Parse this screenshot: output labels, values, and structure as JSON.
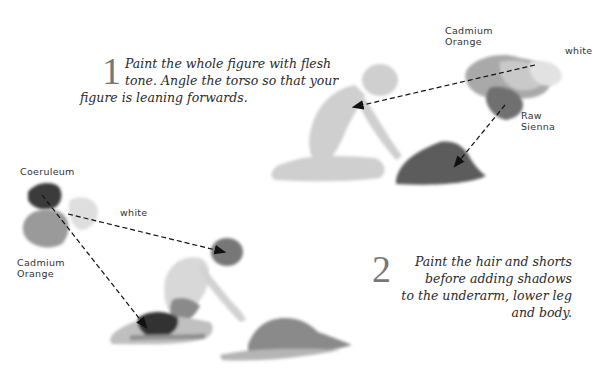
{
  "steps": [
    {
      "number": "1",
      "lines": [
        "Paint the whole figure with flesh",
        "tone. Angle the torso so that your",
        "figure is leaning forwards."
      ]
    },
    {
      "number": "2",
      "lines": [
        "Paint the hair and shorts",
        "before adding shadows",
        "to the underarm, lower leg",
        "and body."
      ]
    }
  ],
  "palette_labels": {
    "top_cadmium": "Cadmium Orange",
    "top_cadmium_l1": "Cadmium",
    "top_cadmium_l2": "Orange",
    "top_white": "white",
    "raw_sienna_l1": "Raw",
    "raw_sienna_l2": "Sienna",
    "coeruleum": "Coeruleum",
    "bottom_white": "white",
    "bottom_cadmium_l1": "Cadmium",
    "bottom_cadmium_l2": "Orange"
  },
  "colors": {
    "text": "#2a2a2a",
    "step_number": "#777777",
    "flesh_wash": "#c8c8c8",
    "shadow": "#6a6a6a",
    "dark": "#333333"
  }
}
